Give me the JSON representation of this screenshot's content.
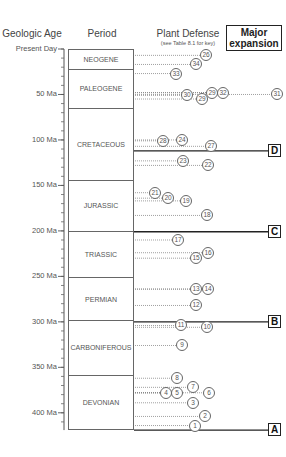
{
  "headers": {
    "geologic_age": "Geologic Age",
    "period": "Period",
    "plant_defense": "Plant Defense",
    "plant_defense_sub": "(see Table 8.1 for key)",
    "major_expansion_line1": "Major",
    "major_expansion_line2": "expansion"
  },
  "axis": {
    "labels": [
      {
        "text": "Present Day",
        "ma": 0
      },
      {
        "text": "50 Ma",
        "ma": 50
      },
      {
        "text": "100 Ma",
        "ma": 100
      },
      {
        "text": "150 Ma",
        "ma": 150
      },
      {
        "text": "200 Ma",
        "ma": 200
      },
      {
        "text": "250 Ma",
        "ma": 250
      },
      {
        "text": "300 Ma",
        "ma": 300
      },
      {
        "text": "350 Ma",
        "ma": 350
      },
      {
        "text": "400 Ma",
        "ma": 400
      }
    ]
  },
  "periods": [
    {
      "name": "NEOGENE",
      "start_ma": 0,
      "end_ma": 23
    },
    {
      "name": "PALEOGENE",
      "start_ma": 23,
      "end_ma": 66
    },
    {
      "name": "CRETACEOUS",
      "start_ma": 66,
      "end_ma": 145
    },
    {
      "name": "JURASSIC",
      "start_ma": 145,
      "end_ma": 201
    },
    {
      "name": "TRIASSIC",
      "start_ma": 201,
      "end_ma": 252
    },
    {
      "name": "PERMIAN",
      "start_ma": 252,
      "end_ma": 299
    },
    {
      "name": "CARBONIFEROUS",
      "start_ma": 299,
      "end_ma": 359
    },
    {
      "name": "DEVONIAN",
      "start_ma": 359,
      "end_ma": 419
    }
  ],
  "expansions": [
    {
      "label": "D",
      "ma": 112
    },
    {
      "label": "C",
      "ma": 201
    },
    {
      "label": "B",
      "ma": 300
    },
    {
      "label": "A",
      "ma": 419
    }
  ],
  "defenses": [
    {
      "id": "26",
      "ma": 7,
      "x": 206
    },
    {
      "id": "34",
      "ma": 17,
      "x": 196
    },
    {
      "id": "33",
      "ma": 27,
      "x": 176
    },
    {
      "id": "29",
      "ma": 48,
      "x": 212
    },
    {
      "id": "32",
      "ma": 48,
      "x": 223
    },
    {
      "id": "31",
      "ma": 50,
      "x": 277
    },
    {
      "id": "30",
      "ma": 51,
      "x": 187
    },
    {
      "id": "29",
      "ma": 55,
      "x": 202
    },
    {
      "id": "28",
      "ma": 101,
      "x": 163
    },
    {
      "id": "24",
      "ma": 100,
      "x": 182
    },
    {
      "id": "27",
      "ma": 107,
      "x": 211
    },
    {
      "id": "23",
      "ma": 123,
      "x": 183
    },
    {
      "id": "22",
      "ma": 128,
      "x": 208
    },
    {
      "id": "21",
      "ma": 158,
      "x": 155
    },
    {
      "id": "20",
      "ma": 164,
      "x": 168
    },
    {
      "id": "19",
      "ma": 167,
      "x": 186
    },
    {
      "id": "18",
      "ma": 183,
      "x": 207
    },
    {
      "id": "17",
      "ma": 210,
      "x": 178
    },
    {
      "id": "16",
      "ma": 224,
      "x": 208
    },
    {
      "id": "15",
      "ma": 230,
      "x": 196
    },
    {
      "id": "13",
      "ma": 264,
      "x": 196
    },
    {
      "id": "14",
      "ma": 264,
      "x": 208
    },
    {
      "id": "12",
      "ma": 282,
      "x": 196
    },
    {
      "id": "11",
      "ma": 304,
      "x": 181
    },
    {
      "id": "10",
      "ma": 306,
      "x": 207
    },
    {
      "id": "9",
      "ma": 326,
      "x": 182
    },
    {
      "id": "8",
      "ma": 362,
      "x": 177
    },
    {
      "id": "7",
      "ma": 372,
      "x": 193
    },
    {
      "id": "6",
      "ma": 378,
      "x": 209
    },
    {
      "id": "4",
      "ma": 378,
      "x": 166
    },
    {
      "id": "5",
      "ma": 378,
      "x": 177
    },
    {
      "id": "3",
      "ma": 389,
      "x": 193
    },
    {
      "id": "2",
      "ma": 404,
      "x": 205
    },
    {
      "id": "1",
      "ma": 414,
      "x": 195
    }
  ],
  "chart_data": {
    "type": "table",
    "xlabel": "",
    "ylabel": "Geologic Age",
    "ylim": [
      0,
      419
    ],
    "y_ticks": [
      "Present Day",
      "50 Ma",
      "100 Ma",
      "150 Ma",
      "200 Ma",
      "250 Ma",
      "300 Ma",
      "350 Ma",
      "400 Ma"
    ],
    "columns": [
      "Geologic Age",
      "Period",
      "Plant Defense (see Table 8.1 for key)",
      "Major expansion"
    ],
    "periods": [
      "NEOGENE",
      "PALEOGENE",
      "CRETACEOUS",
      "JURASSIC",
      "TRIASSIC",
      "PERMIAN",
      "CARBONIFEROUS",
      "DEVONIAN"
    ],
    "major_expansions": [
      {
        "label": "A",
        "age_ma": 419
      },
      {
        "label": "B",
        "age_ma": 300
      },
      {
        "label": "C",
        "age_ma": 201
      },
      {
        "label": "D",
        "age_ma": 112
      }
    ],
    "defense_origins_ma": {
      "1": 414,
      "2": 404,
      "3": 389,
      "4": 378,
      "5": 378,
      "6": 378,
      "7": 372,
      "8": 362,
      "9": 326,
      "10": 306,
      "11": 304,
      "12": 282,
      "13": 264,
      "14": 264,
      "15": 230,
      "16": 224,
      "17": 210,
      "18": 183,
      "19": 167,
      "20": 164,
      "21": 158,
      "22": 128,
      "23": 123,
      "24": 100,
      "27": 107,
      "28": 101,
      "26": 7,
      "29": 55,
      "30": 51,
      "31": 50,
      "32": 48,
      "33": 27,
      "34": 17
    }
  }
}
